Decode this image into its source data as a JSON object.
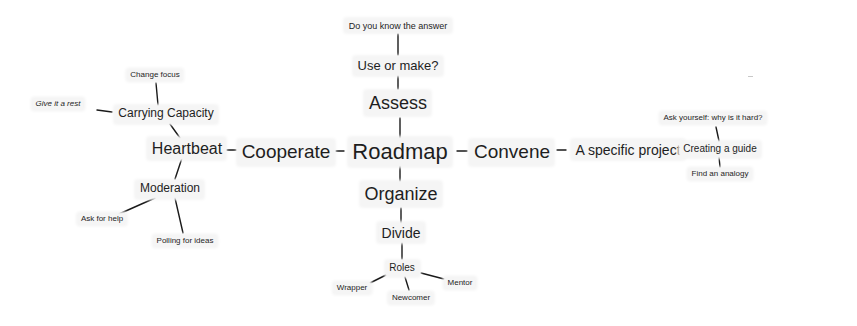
{
  "diagram": {
    "type": "mind-map",
    "root": "Roadmap",
    "nodes": {
      "roadmap": "Roadmap",
      "cooperate": "Cooperate",
      "convene": "Convene",
      "heartbeat": "Heartbeat",
      "assess": "Assess",
      "use_or_make": "Use or make?",
      "do_you_know": "Do you know the answer",
      "organize": "Organize",
      "divide": "Divide",
      "roles": "Roles",
      "wrapper": "Wrapper",
      "newcomer": "Newcomer",
      "mentor": "Mentor",
      "carrying_capacity": "Carrying Capacity",
      "change_focus": "Change focus",
      "give_it_a_rest": "Give it a rest",
      "moderation": "Moderation",
      "ask_for_help": "Ask for help",
      "polling_for_ideas": "Polling for ideas",
      "specific_project": "A specific project",
      "creating_guide": "Creating a guide",
      "ask_yourself": "Ask yourself: why is it hard?",
      "find_analogy": "Find an analogy"
    },
    "edges": [
      [
        "Roadmap",
        "Cooperate"
      ],
      [
        "Roadmap",
        "Convene"
      ],
      [
        "Roadmap",
        "Assess"
      ],
      [
        "Roadmap",
        "Organize"
      ],
      [
        "Assess",
        "Use or make?"
      ],
      [
        "Use or make?",
        "Do you know the answer"
      ],
      [
        "Organize",
        "Divide"
      ],
      [
        "Divide",
        "Roles"
      ],
      [
        "Roles",
        "Wrapper"
      ],
      [
        "Roles",
        "Newcomer"
      ],
      [
        "Roles",
        "Mentor"
      ],
      [
        "Cooperate",
        "Heartbeat"
      ],
      [
        "Heartbeat",
        "Carrying Capacity"
      ],
      [
        "Carrying Capacity",
        "Change focus"
      ],
      [
        "Carrying Capacity",
        "Give it a rest"
      ],
      [
        "Heartbeat",
        "Moderation"
      ],
      [
        "Moderation",
        "Ask for help"
      ],
      [
        "Moderation",
        "Polling for ideas"
      ],
      [
        "Convene",
        "A specific project"
      ],
      [
        "A specific project",
        "Creating a guide"
      ],
      [
        "Creating a guide",
        "Ask yourself: why is it hard?"
      ],
      [
        "Creating a guide",
        "Find an analogy"
      ]
    ]
  }
}
